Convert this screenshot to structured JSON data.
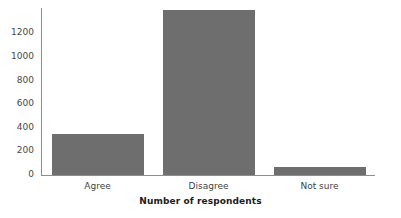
{
  "chart_data": {
    "type": "bar",
    "title": "",
    "subtitle": "",
    "xlabel": "Number of respondents",
    "ylabel": "",
    "categories": [
      "Agree",
      "Disagree",
      "Not sure"
    ],
    "values": [
      350,
      1400,
      65
    ],
    "series": [
      {
        "name": "Number of respondents",
        "values": [
          350,
          1400,
          65
        ]
      }
    ],
    "ylim": [
      0,
      1415
    ],
    "xlim": [
      0,
      3
    ],
    "yticks": [
      0,
      200,
      400,
      600,
      800,
      1000,
      1200
    ],
    "ytick_labels": [
      "0",
      "200",
      "400",
      "600",
      "800",
      "1000",
      "1200"
    ],
    "xtick_labels": [
      "Agree",
      "Disagree",
      "Not sure"
    ],
    "grid": false,
    "legend": false,
    "legend_position": "none",
    "bar_color": "#6e6e6e",
    "axis_color": "#8d8d8d",
    "text_color": "#3f3f3f",
    "background_color": "#ffffff",
    "annotations": []
  },
  "axis": {
    "x_title": "Number of respondents"
  }
}
